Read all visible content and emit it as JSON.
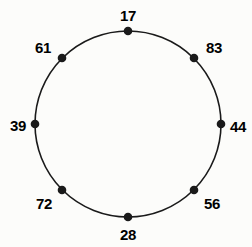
{
  "diagram": {
    "type": "circle-node-diagram",
    "background_color": "#fcfcfa",
    "stroke_color": "#1a1a1a",
    "label_color": "#000000",
    "circle": {
      "center_x": 128,
      "center_y": 124,
      "radius": 93,
      "stroke_width": 1.6
    },
    "node_radius": 4.3,
    "nodes": [
      {
        "label": "17",
        "angle_deg": 90,
        "dot_x": 128,
        "dot_y": 31,
        "label_x": 128,
        "label_y": 15
      },
      {
        "label": "83",
        "angle_deg": 45,
        "dot_x": 194,
        "dot_y": 58,
        "label_x": 214,
        "label_y": 47
      },
      {
        "label": "44",
        "angle_deg": 0,
        "dot_x": 221,
        "dot_y": 124,
        "label_x": 238,
        "label_y": 126
      },
      {
        "label": "56",
        "angle_deg": 315,
        "dot_x": 194,
        "dot_y": 190,
        "label_x": 212,
        "label_y": 203
      },
      {
        "label": "28",
        "angle_deg": 270,
        "dot_x": 128,
        "dot_y": 217,
        "label_x": 128,
        "label_y": 234
      },
      {
        "label": "72",
        "angle_deg": 225,
        "dot_x": 62,
        "dot_y": 190,
        "label_x": 44,
        "label_y": 203
      },
      {
        "label": "39",
        "angle_deg": 180,
        "dot_x": 35,
        "dot_y": 124,
        "label_x": 18,
        "label_y": 125
      },
      {
        "label": "61",
        "angle_deg": 135,
        "dot_x": 62,
        "dot_y": 58,
        "label_x": 43,
        "label_y": 47
      }
    ]
  }
}
